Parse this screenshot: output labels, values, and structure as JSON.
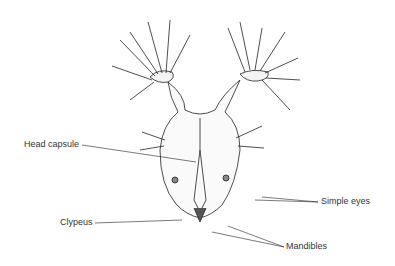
{
  "diagram": {
    "labels": {
      "head_capsule": "Head capsule",
      "clypeus": "Clypeus",
      "simple_eyes": "Simple eyes",
      "mandibles": "Mandibles"
    }
  }
}
